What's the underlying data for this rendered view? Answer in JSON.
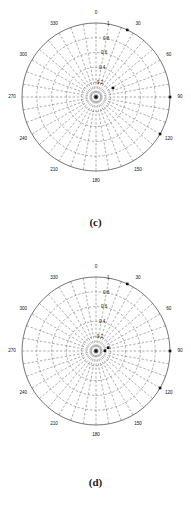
{
  "page": {
    "background_color": "#ffffff",
    "figure_count": 2
  },
  "figures": [
    {
      "id": "c",
      "caption": "(c)"
    },
    {
      "id": "d",
      "caption": "(d)"
    }
  ],
  "chart_data": [
    {
      "type": "scatter",
      "projection": "polar",
      "title": "",
      "subtitle": "",
      "caption": "(c)",
      "xlabel": "",
      "ylabel": "",
      "grid": true,
      "legend": "none",
      "angular_axis": {
        "unit": "degrees",
        "direction": "clockwise",
        "zero_location": "top",
        "tick_step": 30,
        "tick_labels": [
          "0",
          "30",
          "60",
          "90",
          "120",
          "150",
          "180",
          "210",
          "240",
          "270",
          "300",
          "330"
        ],
        "tick_values": [
          0,
          30,
          60,
          90,
          120,
          150,
          180,
          210,
          240,
          270,
          300,
          330
        ]
      },
      "radial_axis": {
        "rlim": [
          0,
          1
        ],
        "tick_labels": [
          "0.2",
          "0.4",
          "0.6",
          "0.8",
          "1"
        ],
        "tick_values": [
          0.2,
          0.4,
          0.6,
          0.8,
          1.0
        ],
        "label_angle_deg": 8
      },
      "minor_spokes_deg": 10,
      "points": [
        {
          "theta": 0,
          "r": 0.0
        },
        {
          "theta": 25,
          "r": 1.0
        },
        {
          "theta": 62,
          "r": 0.26
        },
        {
          "theta": 90,
          "r": 1.0
        },
        {
          "theta": 120,
          "r": 1.0
        }
      ],
      "marker": {
        "shape": "square",
        "color": "#111111",
        "size_px": 2.6
      }
    },
    {
      "type": "scatter",
      "projection": "polar",
      "title": "",
      "subtitle": "",
      "caption": "(d)",
      "xlabel": "",
      "ylabel": "",
      "grid": true,
      "legend": "none",
      "angular_axis": {
        "unit": "degrees",
        "direction": "clockwise",
        "zero_location": "top",
        "tick_step": 30,
        "tick_labels": [
          "0",
          "30",
          "60",
          "90",
          "120",
          "150",
          "180",
          "210",
          "240",
          "270",
          "300",
          "330"
        ],
        "tick_values": [
          0,
          30,
          60,
          90,
          120,
          150,
          180,
          210,
          240,
          270,
          300,
          330
        ]
      },
      "radial_axis": {
        "rlim": [
          0,
          1
        ],
        "tick_labels": [
          "0.2",
          "0.4",
          "0.6",
          "0.8",
          "1"
        ],
        "tick_values": [
          0.2,
          0.4,
          0.6,
          0.8,
          1.0
        ],
        "label_angle_deg": 8
      },
      "minor_spokes_deg": 10,
      "points": [
        {
          "theta": 0,
          "r": 0.0
        },
        {
          "theta": 25,
          "r": 1.0
        },
        {
          "theta": 75,
          "r": 0.17
        },
        {
          "theta": 88,
          "r": 0.12
        },
        {
          "theta": 90,
          "r": 1.0
        },
        {
          "theta": 120,
          "r": 1.0
        }
      ],
      "marker": {
        "shape": "square",
        "color": "#111111",
        "size_px": 2.6
      }
    }
  ],
  "geometry": {
    "center_x": 96,
    "center_y": 97,
    "radius": 74,
    "angular_label_offset": 10
  },
  "colors": {
    "outer_circle": "#3a3a3a",
    "grid": "#6b6b6b",
    "text": "#111111",
    "marker": "#111111"
  }
}
